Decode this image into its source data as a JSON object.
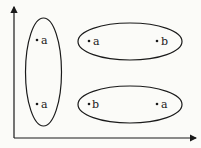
{
  "diagram": {
    "axes": {
      "x_axis_label": "",
      "y_axis_label": ""
    },
    "colors": {
      "stroke": "#1a1a1a",
      "background": "#fbfbf8"
    },
    "clusters": [
      {
        "name": "left-vertical-cluster",
        "points": [
          {
            "label": "a"
          },
          {
            "label": "a"
          }
        ]
      },
      {
        "name": "top-right-cluster",
        "points": [
          {
            "label": "a"
          },
          {
            "label": "b"
          }
        ]
      },
      {
        "name": "bottom-right-cluster",
        "points": [
          {
            "label": "b"
          },
          {
            "label": "a"
          }
        ]
      }
    ]
  }
}
